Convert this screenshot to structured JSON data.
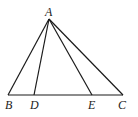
{
  "diagram": {
    "type": "triangle",
    "points": {
      "A": {
        "label": "A",
        "x": 49,
        "y": 19
      },
      "B": {
        "label": "B",
        "x": 8,
        "y": 95
      },
      "D": {
        "label": "D",
        "x": 34,
        "y": 95
      },
      "E": {
        "label": "E",
        "x": 92,
        "y": 95
      },
      "C": {
        "label": "C",
        "x": 123,
        "y": 95
      }
    },
    "segments": [
      [
        "A",
        "B"
      ],
      [
        "A",
        "D"
      ],
      [
        "A",
        "E"
      ],
      [
        "A",
        "C"
      ],
      [
        "B",
        "C"
      ]
    ],
    "labels": {
      "A": "A",
      "B": "B",
      "D": "D",
      "E": "E",
      "C": "C"
    }
  }
}
